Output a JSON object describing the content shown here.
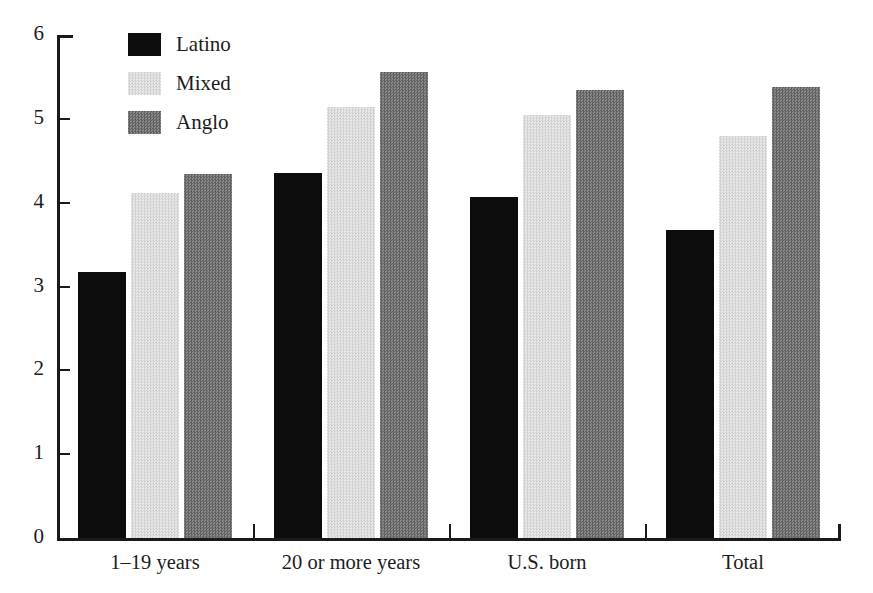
{
  "chart_data": {
    "type": "bar",
    "title": "",
    "subtitle": "",
    "xlabel": "",
    "ylabel": "",
    "ylim": [
      0,
      6
    ],
    "yticks": [
      "0",
      "1",
      "2",
      "3",
      "4",
      "5",
      "6"
    ],
    "grid": false,
    "legend_position": "top-left",
    "categories": [
      "1–19 years",
      "20 or more years",
      "U.S. born",
      "Total"
    ],
    "series": [
      {
        "name": "Latino",
        "color": "#0c0c0c",
        "values": [
          3.17,
          4.35,
          4.07,
          3.67
        ]
      },
      {
        "name": "Mixed",
        "color": "#dedede",
        "values": [
          4.11,
          5.14,
          5.04,
          4.8
        ]
      },
      {
        "name": "Anglo",
        "color": "#767676",
        "values": [
          4.34,
          5.56,
          5.34,
          5.38
        ]
      }
    ]
  },
  "legend": {
    "items": [
      {
        "label": "Latino",
        "swatch": "latino"
      },
      {
        "label": "Mixed",
        "swatch": "mixed"
      },
      {
        "label": "Anglo",
        "swatch": "anglo"
      }
    ]
  }
}
